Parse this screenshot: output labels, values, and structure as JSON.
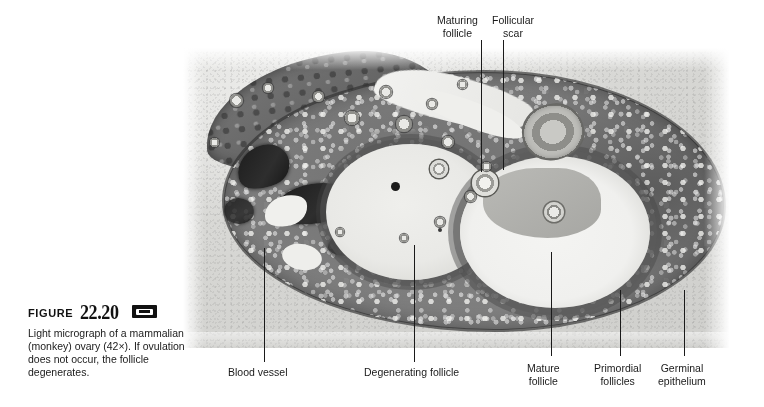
{
  "figure": {
    "label_word": "Figure",
    "number": "22.20",
    "media_icon": "videotape-icon",
    "caption": "Light micrograph of a mammalian (monkey) ovary (42×). If ovulation does not occur, the follicle degenerates."
  },
  "specimen": {
    "subject": "mammalian (monkey) ovary",
    "magnification": "42×",
    "image_type": "light micrograph"
  },
  "callouts": [
    {
      "name": "maturing-follicle",
      "label": "Maturing\nfollicle",
      "position": "top",
      "label_x": 437,
      "label_y": 14,
      "line_x": 481,
      "line_y1": 40,
      "line_y2": 172
    },
    {
      "name": "follicular-scar",
      "label": "Follicular\nscar",
      "position": "top",
      "label_x": 492,
      "label_y": 14,
      "line_x": 503,
      "line_y1": 40,
      "line_y2": 170
    },
    {
      "name": "blood-vessel",
      "label": "Blood vessel",
      "position": "bottom",
      "label_x": 228,
      "label_y": 366,
      "line_x": 264,
      "line_y1": 248,
      "line_y2": 362
    },
    {
      "name": "degenerating-follicle",
      "label": "Degenerating follicle",
      "position": "bottom",
      "label_x": 364,
      "label_y": 366,
      "line_x": 414,
      "line_y1": 245,
      "line_y2": 362
    },
    {
      "name": "mature-follicle",
      "label": "Mature\nfollicle",
      "position": "bottom",
      "label_x": 527,
      "label_y": 362,
      "line_x": 551,
      "line_y1": 252,
      "line_y2": 356
    },
    {
      "name": "primordial-follicles",
      "label": "Primordial\nfollicles",
      "position": "bottom",
      "label_x": 594,
      "label_y": 362,
      "line_x": 620,
      "line_y1": 290,
      "line_y2": 356
    },
    {
      "name": "germinal-epithelium",
      "label": "Germinal\nepithelium",
      "position": "bottom",
      "label_x": 658,
      "label_y": 362,
      "line_x": 684,
      "line_y1": 290,
      "line_y2": 356
    }
  ],
  "colors": {
    "page_background": "#ffffff",
    "slide_background": "#d9d9d6",
    "tissue_mid": "#7a7a7a",
    "tissue_dark": "#1d1d1d",
    "antrum_light": "#f2f2f0",
    "text": "#1a1a1a"
  },
  "scattered_follicles": [
    {
      "x": 236,
      "y": 100,
      "d": 13
    },
    {
      "x": 268,
      "y": 88,
      "d": 10
    },
    {
      "x": 318,
      "y": 96,
      "d": 11
    },
    {
      "x": 352,
      "y": 118,
      "d": 14
    },
    {
      "x": 386,
      "y": 92,
      "d": 12
    },
    {
      "x": 404,
      "y": 124,
      "d": 16
    },
    {
      "x": 432,
      "y": 104,
      "d": 10
    },
    {
      "x": 448,
      "y": 142,
      "d": 12
    },
    {
      "x": 462,
      "y": 84,
      "d": 9
    },
    {
      "x": 214,
      "y": 142,
      "d": 9
    },
    {
      "x": 470,
      "y": 196,
      "d": 11
    },
    {
      "x": 486,
      "y": 166,
      "d": 9
    },
    {
      "x": 440,
      "y": 222,
      "d": 10
    },
    {
      "x": 404,
      "y": 238,
      "d": 8
    },
    {
      "x": 340,
      "y": 232,
      "d": 8
    }
  ]
}
